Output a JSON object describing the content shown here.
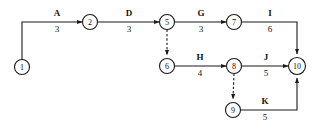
{
  "diagram": {
    "type": "activity-on-arrow-network",
    "title": "",
    "background_color": "#ffffff",
    "line_color": "#1a1a1a",
    "text_color": "#111111",
    "nodes": [
      {
        "id": "1",
        "label": "1",
        "cx": 22,
        "cy": 67,
        "r": 7.5
      },
      {
        "id": "2",
        "label": "2",
        "cx": 90,
        "cy": 22,
        "r": 7.5
      },
      {
        "id": "5",
        "label": "5",
        "cx": 167,
        "cy": 22,
        "r": 7.5
      },
      {
        "id": "6",
        "label": "6",
        "cx": 167,
        "cy": 66,
        "r": 7.5
      },
      {
        "id": "7",
        "label": "7",
        "cx": 234,
        "cy": 22,
        "r": 7.5
      },
      {
        "id": "8",
        "label": "8",
        "cx": 234,
        "cy": 66,
        "r": 7.5
      },
      {
        "id": "9",
        "label": "9",
        "cx": 233,
        "cy": 110,
        "r": 7.5
      },
      {
        "id": "10",
        "label": "10",
        "cx": 297,
        "cy": 66,
        "r": 8.5
      }
    ],
    "activities": [
      {
        "name": "A",
        "duration": "3",
        "from": "1",
        "to": "2",
        "style": "solid",
        "label_x": 57,
        "name_y": 16,
        "dur_y": 32
      },
      {
        "name": "D",
        "duration": "3",
        "from": "2",
        "to": "5",
        "style": "solid",
        "label_x": 129,
        "name_y": 16,
        "dur_y": 32
      },
      {
        "name": "G",
        "duration": "3",
        "from": "5",
        "to": "7",
        "style": "solid",
        "label_x": 201,
        "name_y": 16,
        "dur_y": 32
      },
      {
        "name": "I",
        "duration": "6",
        "from": "7",
        "to": "10",
        "style": "solid",
        "label_x": 270,
        "name_y": 16,
        "dur_y": 32
      },
      {
        "name": "H",
        "duration": "4",
        "from": "6",
        "to": "8",
        "style": "solid",
        "label_x": 200,
        "name_y": 60,
        "dur_y": 76
      },
      {
        "name": "J",
        "duration": "5",
        "from": "8",
        "to": "10",
        "style": "solid",
        "label_x": 266,
        "name_y": 60,
        "dur_y": 76
      },
      {
        "name": "K",
        "duration": "5",
        "from": "9",
        "to": "10",
        "style": "solid",
        "label_x": 265,
        "name_y": 104,
        "dur_y": 120
      },
      {
        "name": "",
        "duration": "",
        "from": "5",
        "to": "6",
        "style": "dashed",
        "label_x": 0,
        "name_y": 0,
        "dur_y": 0
      },
      {
        "name": "",
        "duration": "",
        "from": "8",
        "to": "9",
        "style": "dashed",
        "label_x": 0,
        "name_y": 0,
        "dur_y": 0
      }
    ]
  }
}
